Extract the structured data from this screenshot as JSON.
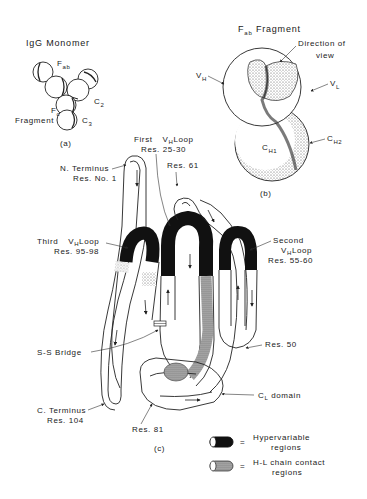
{
  "panel_a": {
    "title": "IgG Monomer",
    "labels": {
      "fab_main": "F",
      "fab_sub": "ab",
      "c2_main": "C",
      "c2_sub": "2",
      "fc_main": "F",
      "fc_sub": "c",
      "fragment": "Fragment",
      "c3_main": "C",
      "c3_sub": "3"
    },
    "caption": "(a)"
  },
  "panel_b": {
    "title_main": "F",
    "title_sub": "ab",
    "title_rest": " Fragment",
    "direction_line1": "Direction of",
    "direction_line2": "view",
    "vh_main": "V",
    "vh_sub": "H",
    "vl_main": "V",
    "vl_sub": "L",
    "ch1_main": "C",
    "ch1_sub": "H1",
    "ch2_main": "C",
    "ch2_sub": "H2",
    "caption": "(b)"
  },
  "panel_c": {
    "caption": "(c)",
    "labels": {
      "first_loop_line1_a": "First",
      "first_loop_line1_b_main": "V",
      "first_loop_line1_b_sub": "H",
      "first_loop_line1_c": "Loop",
      "first_loop_line2": "Res. 25-30",
      "n_terminus_line1": "N. Terminus",
      "n_terminus_line2": "Res. No. 1",
      "res61": "Res. 61",
      "third_loop_line1_a": "Third",
      "third_loop_line1_b_main": "V",
      "third_loop_line1_b_sub": "H",
      "third_loop_line1_c": "Loop",
      "third_loop_line2": "Res. 95-98",
      "second_loop_line1": "Second",
      "second_loop_line2_main": "V",
      "second_loop_line2_sub": "H",
      "second_loop_line2_rest": "Loop",
      "second_loop_line3": "Res. 55-60",
      "ss_bridge": "S-S Bridge",
      "res50": "Res. 50",
      "cl_domain_main": "C",
      "cl_domain_sub": "L",
      "cl_domain_rest": " domain",
      "c_terminus_line1": "C. Terminus",
      "c_terminus_line2": "Res. 104",
      "res81": "Res. 81"
    }
  },
  "legend": {
    "items": [
      {
        "symbol": "hypervariable-swatch",
        "equals": "=",
        "line1": "Hypervariable",
        "line2": "regions"
      },
      {
        "symbol": "contact-swatch",
        "equals": "=",
        "line1": "H-L chain contact",
        "line2": "regions"
      }
    ]
  }
}
